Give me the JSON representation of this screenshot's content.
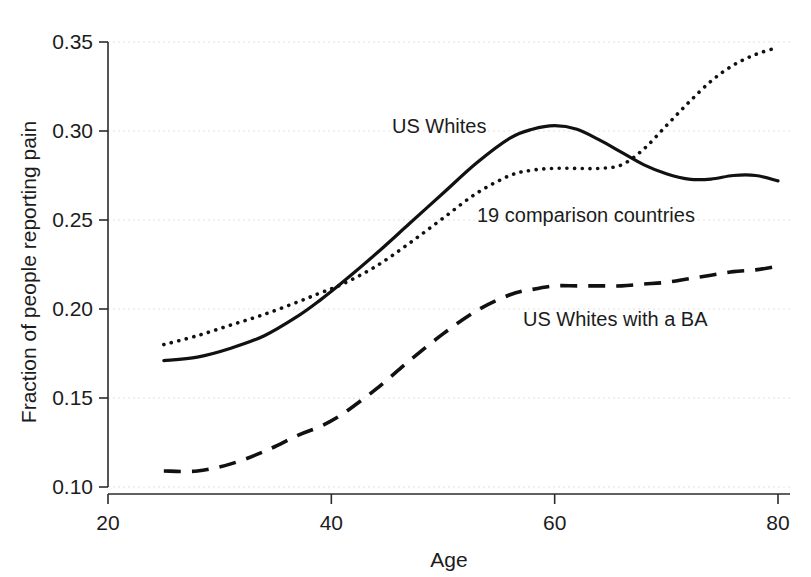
{
  "chart_data": {
    "type": "line",
    "title": "",
    "xlabel": "Age",
    "ylabel": "Fraction of people reporting pain",
    "xlim": [
      20,
      80
    ],
    "ylim": [
      0.1,
      0.35
    ],
    "xticks": [
      "20",
      "40",
      "60",
      "80"
    ],
    "xtick_values": [
      20,
      40,
      60,
      80
    ],
    "yticks": [
      "0.10",
      "0.15",
      "0.20",
      "0.25",
      "0.30",
      "0.35"
    ],
    "ytick_values": [
      0.1,
      0.15,
      0.2,
      0.25,
      0.3,
      0.35
    ],
    "grid": true,
    "legend_position": "inline-annotations",
    "series": [
      {
        "name": "US Whites",
        "style": "solid",
        "label": "US Whites",
        "x": [
          25,
          28,
          31,
          34,
          37,
          39,
          41,
          44,
          47,
          50,
          53,
          56,
          58,
          60,
          62,
          64,
          66,
          68,
          70,
          72,
          74,
          76,
          78,
          80
        ],
        "values": [
          0.171,
          0.173,
          0.178,
          0.185,
          0.196,
          0.205,
          0.215,
          0.231,
          0.248,
          0.265,
          0.282,
          0.296,
          0.301,
          0.303,
          0.301,
          0.295,
          0.288,
          0.281,
          0.276,
          0.273,
          0.273,
          0.275,
          0.275,
          0.272
        ]
      },
      {
        "name": "19 comparison countries",
        "style": "dotted",
        "label": "19 comparison countries",
        "x": [
          25,
          28,
          31,
          34,
          37,
          39,
          41,
          44,
          47,
          50,
          53,
          56,
          58,
          60,
          62,
          64,
          66,
          68,
          70,
          72,
          74,
          76,
          78,
          80
        ],
        "values": [
          0.18,
          0.185,
          0.191,
          0.197,
          0.204,
          0.209,
          0.214,
          0.224,
          0.237,
          0.251,
          0.265,
          0.275,
          0.278,
          0.279,
          0.279,
          0.279,
          0.281,
          0.29,
          0.303,
          0.316,
          0.328,
          0.337,
          0.343,
          0.347
        ]
      },
      {
        "name": "US Whites with a BA",
        "style": "dashed",
        "label": "US Whites with a BA",
        "x": [
          25,
          28,
          31,
          34,
          37,
          39,
          41,
          44,
          47,
          50,
          53,
          56,
          58,
          60,
          62,
          64,
          66,
          68,
          70,
          72,
          74,
          76,
          78,
          80
        ],
        "values": [
          0.109,
          0.109,
          0.113,
          0.12,
          0.129,
          0.134,
          0.141,
          0.155,
          0.171,
          0.186,
          0.199,
          0.208,
          0.211,
          0.213,
          0.213,
          0.213,
          0.213,
          0.214,
          0.215,
          0.217,
          0.219,
          0.221,
          0.222,
          0.224
        ]
      }
    ],
    "annotations": [
      {
        "text": "US Whites",
        "x_px": 392,
        "y_px": 133
      },
      {
        "text": "19 comparison countries",
        "x_px": 477,
        "y_px": 222
      },
      {
        "text": "US Whites with a BA",
        "x_px": 523,
        "y_px": 326
      }
    ],
    "colors": {
      "line": "#111111",
      "axis": "#2b2b2b",
      "grid": "#d9d9d9",
      "background": "#ffffff"
    }
  }
}
